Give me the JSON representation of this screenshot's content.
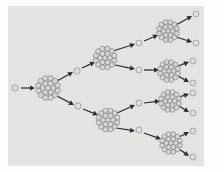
{
  "figure": {
    "background_color": "#e3e3e1",
    "page_color": "#fdfdfd",
    "arrow_color": "#2d2d31",
    "neutron_color": "#dedede",
    "nucleon_color": "#d6d6d4",
    "nucleon_stroke": "#6d6d72",
    "plate": {
      "x": 8,
      "y": 6,
      "width": 196,
      "height": 160
    }
  },
  "chart_data": {
    "type": "diagram",
    "xlabel": "",
    "ylabel": "",
    "generations": 4,
    "branching_factor": 2,
    "nuclei": [
      {
        "id": "n0",
        "generation": 1,
        "cx": 48,
        "cy": 88,
        "r": 11.5,
        "nucleon_count": 19
      },
      {
        "id": "n1",
        "generation": 2,
        "cx": 105,
        "cy": 58,
        "r": 11.0,
        "nucleon_count": 19
      },
      {
        "id": "n2",
        "generation": 2,
        "cx": 108,
        "cy": 120,
        "r": 11.0,
        "nucleon_count": 19
      },
      {
        "id": "n3",
        "generation": 3,
        "cx": 168,
        "cy": 31,
        "r": 10.5,
        "nucleon_count": 19
      },
      {
        "id": "n4",
        "generation": 3,
        "cx": 169,
        "cy": 71,
        "r": 10.5,
        "nucleon_count": 19
      },
      {
        "id": "n5",
        "generation": 3,
        "cx": 170,
        "cy": 101,
        "r": 10.5,
        "nucleon_count": 19
      },
      {
        "id": "n6",
        "generation": 3,
        "cx": 171,
        "cy": 143,
        "r": 10.5,
        "nucleon_count": 19
      }
    ],
    "neutrons": [
      {
        "id": "in0",
        "label": "incident-neutron",
        "cx": 15,
        "cy": 88,
        "r": 3.2
      },
      {
        "id": "f1",
        "label": "fission-neutron",
        "cx": 77,
        "cy": 71,
        "r": 3.2
      },
      {
        "id": "f2",
        "label": "fission-neutron",
        "cx": 78,
        "cy": 106,
        "r": 3.2
      },
      {
        "id": "f3",
        "label": "fission-neutron",
        "cx": 139,
        "cy": 43,
        "r": 3.0
      },
      {
        "id": "f4",
        "label": "fission-neutron",
        "cx": 139,
        "cy": 70,
        "r": 3.0
      },
      {
        "id": "f5",
        "label": "fission-neutron",
        "cx": 139,
        "cy": 103,
        "r": 3.0
      },
      {
        "id": "f6",
        "label": "fission-neutron",
        "cx": 139,
        "cy": 130,
        "r": 3.0
      },
      {
        "id": "e1",
        "label": "emitted-neutron",
        "cx": 196,
        "cy": 14,
        "r": 3.0
      },
      {
        "id": "e2",
        "label": "emitted-neutron",
        "cx": 196,
        "cy": 43,
        "r": 3.0
      },
      {
        "id": "e3",
        "label": "emitted-neutron",
        "cx": 193,
        "cy": 61,
        "r": 3.0
      },
      {
        "id": "e4",
        "label": "emitted-neutron",
        "cx": 193,
        "cy": 83,
        "r": 3.0
      },
      {
        "id": "e5",
        "label": "emitted-neutron",
        "cx": 193,
        "cy": 93,
        "r": 3.0
      },
      {
        "id": "e6",
        "label": "emitted-neutron",
        "cx": 193,
        "cy": 113,
        "r": 3.0
      },
      {
        "id": "e7",
        "label": "emitted-neutron",
        "cx": 193,
        "cy": 131,
        "r": 3.0
      },
      {
        "id": "e8",
        "label": "emitted-neutron",
        "cx": 193,
        "cy": 157,
        "r": 3.0
      }
    ],
    "tracks": [
      {
        "id": "t0",
        "from": "in0",
        "to": "n0",
        "x1": 21,
        "y1": 88,
        "x2": 35,
        "y2": 88
      },
      {
        "id": "t1",
        "from": "n0",
        "to": "f1",
        "x1": 57,
        "y1": 81,
        "x2": 73,
        "y2": 72
      },
      {
        "id": "t2",
        "from": "f1",
        "to": "n1",
        "x1": 82,
        "y1": 68,
        "x2": 95,
        "y2": 62
      },
      {
        "id": "t3",
        "from": "n0",
        "to": "f2",
        "x1": 57,
        "y1": 96,
        "x2": 74,
        "y2": 105
      },
      {
        "id": "t4",
        "from": "f2",
        "to": "n2",
        "x1": 83,
        "y1": 109,
        "x2": 98,
        "y2": 115
      },
      {
        "id": "t5",
        "from": "n1",
        "to": "f3",
        "x1": 113,
        "y1": 51,
        "x2": 135,
        "y2": 44
      },
      {
        "id": "t6",
        "from": "f3",
        "to": "n3",
        "x1": 144,
        "y1": 41,
        "x2": 158,
        "y2": 35
      },
      {
        "id": "t7",
        "from": "n1",
        "to": "f4",
        "x1": 115,
        "y1": 65,
        "x2": 135,
        "y2": 69
      },
      {
        "id": "t8",
        "from": "f4",
        "to": "n4",
        "x1": 144,
        "y1": 70,
        "x2": 159,
        "y2": 70
      },
      {
        "id": "t9",
        "from": "n2",
        "to": "f5",
        "x1": 117,
        "y1": 113,
        "x2": 135,
        "y2": 105
      },
      {
        "id": "t10",
        "from": "f5",
        "to": "n5",
        "x1": 144,
        "y1": 103,
        "x2": 160,
        "y2": 101
      },
      {
        "id": "t11",
        "from": "n2",
        "to": "f6",
        "x1": 116,
        "y1": 128,
        "x2": 135,
        "y2": 131
      },
      {
        "id": "t12",
        "from": "f6",
        "to": "n6",
        "x1": 144,
        "y1": 133,
        "x2": 161,
        "y2": 139
      },
      {
        "id": "t13",
        "from": "n3",
        "to": "e1",
        "x1": 176,
        "y1": 25,
        "x2": 192,
        "y2": 16
      },
      {
        "id": "t14",
        "from": "n3",
        "to": "e2",
        "x1": 176,
        "y1": 37,
        "x2": 192,
        "y2": 42
      },
      {
        "id": "t15",
        "from": "n4",
        "to": "e3",
        "x1": 178,
        "y1": 66,
        "x2": 189,
        "y2": 62
      },
      {
        "id": "t16",
        "from": "n4",
        "to": "e4",
        "x1": 178,
        "y1": 76,
        "x2": 189,
        "y2": 82
      },
      {
        "id": "t17",
        "from": "n5",
        "to": "e5",
        "x1": 179,
        "y1": 97,
        "x2": 189,
        "y2": 94
      },
      {
        "id": "t18",
        "from": "n5",
        "to": "e6",
        "x1": 179,
        "y1": 106,
        "x2": 189,
        "y2": 112
      },
      {
        "id": "t19",
        "from": "n6",
        "to": "e7",
        "x1": 179,
        "y1": 137,
        "x2": 189,
        "y2": 132
      },
      {
        "id": "t20",
        "from": "n6",
        "to": "e8",
        "x1": 179,
        "y1": 149,
        "x2": 189,
        "y2": 156
      }
    ],
    "legend": {
      "position": "none",
      "entries": []
    },
    "grid": false
  }
}
